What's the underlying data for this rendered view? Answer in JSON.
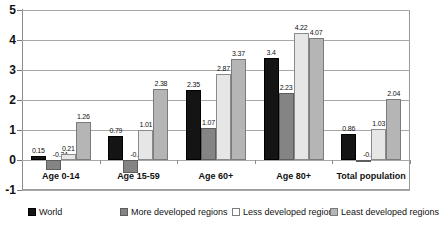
{
  "chart_data": {
    "type": "bar",
    "title": "",
    "xlabel": "",
    "ylabel": "",
    "ylim": [
      -1,
      5
    ],
    "yticks": [
      "-1",
      "0",
      "1",
      "2",
      "3",
      "4",
      "5"
    ],
    "grid": true,
    "legend_position": "bottom",
    "categories": [
      "Age 0-14",
      "Age 15-59",
      "Age 60+",
      "Age 80+",
      "Total population"
    ],
    "series": [
      {
        "name": "World",
        "color": "#141414",
        "values": [
          0.15,
          0.79,
          2.35,
          3.4,
          0.86
        ],
        "labels": [
          "0.15",
          "0.79",
          "2.35",
          "3.4",
          "0.86"
        ]
      },
      {
        "name": "More developed regions",
        "color": "#848484",
        "values": [
          -0.34,
          -0.42,
          1.07,
          2.23,
          -0.02
        ],
        "labels": [
          "-0.34",
          "-0.42",
          "1.07",
          "2.23",
          "-0.02"
        ]
      },
      {
        "name": "Less developed regions",
        "color": "#e6e6e6",
        "values": [
          0.21,
          1.01,
          2.87,
          4.22,
          1.03
        ],
        "labels": [
          "0.21",
          "1.01",
          "2.87",
          "4.22",
          "1.03"
        ]
      },
      {
        "name": "Least developed regions",
        "color": "#b5b5b5",
        "values": [
          1.26,
          2.38,
          3.37,
          4.07,
          2.04
        ],
        "labels": [
          "1.26",
          "2.38",
          "3.37",
          "4.07",
          "2.04"
        ]
      }
    ]
  }
}
